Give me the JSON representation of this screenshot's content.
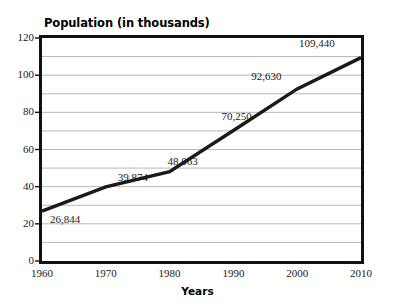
{
  "chart_data": {
    "type": "line",
    "title": "Population (in thousands)",
    "xlabel": "Years",
    "ylabel": "",
    "x": [
      1960,
      1970,
      1980,
      1990,
      2000,
      2010
    ],
    "categories": [
      "1960",
      "1970",
      "1980",
      "1990",
      "2000",
      "2010"
    ],
    "values": [
      26.844,
      39.874,
      48.063,
      70.25,
      92.63,
      109.44
    ],
    "point_labels": [
      "26,844",
      "39,874",
      "48,063",
      "70,250",
      "92,630",
      "109,440"
    ],
    "xlim": [
      1960,
      2010
    ],
    "ylim": [
      0,
      120
    ],
    "ytick_labels": [
      "0",
      "20",
      "40",
      "60",
      "80",
      "100",
      "120"
    ],
    "ytick_values": [
      0,
      20,
      40,
      60,
      80,
      100,
      120
    ],
    "gridlines_y": [
      10,
      20,
      30,
      40,
      50,
      60,
      70,
      80,
      90,
      100,
      110
    ],
    "grid": true,
    "grid_axis": "y",
    "legend": "none",
    "series": [
      {
        "name": "Population",
        "values": [
          26.844,
          39.874,
          48.063,
          70.25,
          92.63,
          109.44
        ]
      }
    ],
    "colors": {
      "line": "#1a1a1a",
      "axis": "#111111",
      "grid": "#b8b8b8",
      "background": "#ffffff",
      "text": "#1a1a1a"
    }
  }
}
